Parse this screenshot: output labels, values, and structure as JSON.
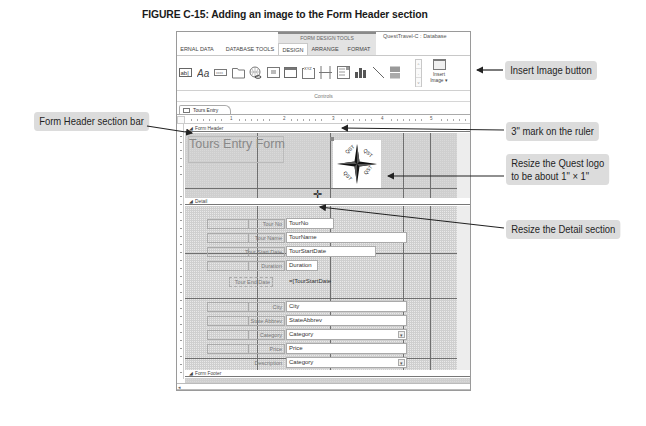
{
  "figure": {
    "prefix": "FIGURE C-15:",
    "title": "Adding an image to the Form Header section"
  },
  "window": {
    "app_title": "QuestTravel-C : Database",
    "context_tab": "FORM DESIGN TOOLS",
    "ribbon_tabs": [
      {
        "label": "ERNAL DATA",
        "state": "normal"
      },
      {
        "label": "DATABASE TOOLS",
        "state": "normal"
      },
      {
        "label": "DESIGN",
        "state": "active"
      },
      {
        "label": "ARRANGE",
        "state": "context"
      },
      {
        "label": "FORMAT",
        "state": "context"
      }
    ],
    "ribbon": {
      "group_label": "Controls",
      "controls": [
        {
          "name": "text-box-icon",
          "label": "ab|"
        },
        {
          "name": "label-icon",
          "label": "Aa"
        },
        {
          "name": "button-icon",
          "label": "xxxx"
        },
        {
          "name": "tab-control-icon",
          "label": ""
        },
        {
          "name": "hyperlink-icon",
          "label": ""
        },
        {
          "name": "web-browser-icon",
          "label": ""
        },
        {
          "name": "navigation-control-icon",
          "label": ""
        },
        {
          "name": "option-group-icon",
          "label": "XYZ"
        },
        {
          "name": "page-break-icon",
          "label": ""
        },
        {
          "name": "combo-box-icon",
          "label": ""
        },
        {
          "name": "chart-icon",
          "label": ""
        },
        {
          "name": "line-icon",
          "label": ""
        },
        {
          "name": "toggle-button-icon",
          "label": ""
        }
      ],
      "gallery_scroll": [
        "^",
        "-",
        "v"
      ],
      "insert_image": {
        "line1": "Insert",
        "line2": "Image ▾"
      }
    },
    "document_tab": "Tours Entry Form",
    "ruler_numbers": [
      "1",
      "2",
      "3",
      "4",
      "5"
    ],
    "sections": {
      "form_header": "Form Header",
      "detail": "Detail",
      "form_footer": "Form Footer"
    },
    "header_title": "Tours Entry Form",
    "logo_text": "QUEST",
    "fields": [
      {
        "label": "Tour No",
        "value": "TourNo",
        "type": "text"
      },
      {
        "label": "Tour Name",
        "value": "TourName",
        "type": "text"
      },
      {
        "label": "Tour Start Date",
        "value": "TourStartDate",
        "type": "text"
      },
      {
        "label": "Duration",
        "value": "Duration",
        "type": "text"
      },
      {
        "label": "Tour End Date",
        "value": "=[TourStartDate",
        "type": "text"
      },
      {
        "label": "City",
        "value": "City",
        "type": "text"
      },
      {
        "label": "State Abbrev",
        "value": "StateAbbrev",
        "type": "text"
      },
      {
        "label": "Category",
        "value": "Category",
        "type": "combo"
      },
      {
        "label": "Price",
        "value": "Price",
        "type": "text"
      },
      {
        "label": "Description",
        "value": "Category",
        "type": "combo"
      }
    ],
    "hscroll_left": "◂"
  },
  "callouts": {
    "insert_image": "Insert Image button",
    "form_header_bar": "Form Header section bar",
    "ruler_mark": "3\" mark on the ruler",
    "resize_logo_line1": "Resize the Quest logo",
    "resize_logo_line2": "to be about 1\" × 1\"",
    "resize_detail": "Resize the Detail section"
  },
  "cursor": "✛"
}
